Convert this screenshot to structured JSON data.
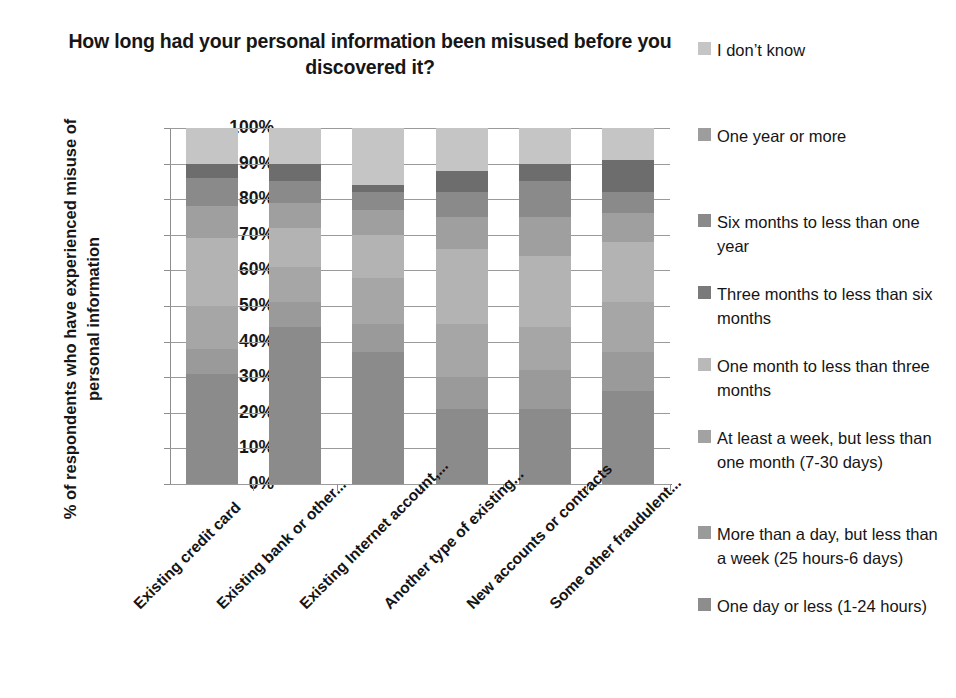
{
  "chart_data": {
    "type": "bar",
    "subtype": "stacked-bar-100-percent",
    "title": "How long had your personal information been misused before you discovered it?",
    "xlabel": "",
    "ylabel": "% of respondents who have experienced misuse of personal information",
    "ylim": [
      0,
      100
    ],
    "ytick_labels": [
      "100%",
      "90%",
      "80%",
      "70%",
      "60%",
      "50%",
      "40%",
      "30%",
      "20%",
      "10%",
      "0%"
    ],
    "ytick_values": [
      100,
      90,
      80,
      70,
      60,
      50,
      40,
      30,
      20,
      10,
      0
    ],
    "grid": true,
    "legend_position": "right",
    "categories": [
      "Existing credit card",
      "Existing bank or other...",
      "Existing Internet account,...",
      "Another type of existing...",
      "New accounts or contracts",
      "Some other fraudulent..."
    ],
    "series": [
      {
        "name": "One day or less (1-24 hours)",
        "color": "#8b8b8b",
        "values": [
          31,
          44,
          37,
          21,
          21,
          26
        ]
      },
      {
        "name": "More than a day, but less than a week (25 hours-6 days)",
        "color": "#9a9a9a",
        "values": [
          7,
          7,
          8,
          9,
          11,
          11
        ]
      },
      {
        "name": "At least a week, but less than one month (7-30 days)",
        "color": "#a6a6a6",
        "values": [
          12,
          10,
          13,
          15,
          12,
          14
        ]
      },
      {
        "name": "One month to less than three months",
        "color": "#b3b3b3",
        "values": [
          19,
          11,
          12,
          21,
          20,
          17
        ]
      },
      {
        "name": "Three months to less than six months",
        "color": "#9f9f9f",
        "values": [
          9,
          7,
          7,
          9,
          11,
          8
        ]
      },
      {
        "name": "Six months to less than one year",
        "color": "#8a8a8a",
        "values": [
          8,
          6,
          5,
          7,
          10,
          6
        ]
      },
      {
        "name": "One year or more",
        "color": "#6d6d6d",
        "values": [
          4,
          5,
          2,
          6,
          5,
          9
        ]
      },
      {
        "name": "I don't know",
        "color": "#c5c5c5",
        "values": [
          10,
          10,
          16,
          12,
          10,
          9
        ]
      }
    ]
  },
  "legend": {
    "items": [
      {
        "label": "I don’t know",
        "color": "#c5c5c5",
        "top": 8,
        "swatch": "legend-swatch-i-dont-know"
      },
      {
        "label": "One year or more",
        "color": "#9d9d9d",
        "top": 94,
        "swatch": "legend-swatch-one-year-or-more"
      },
      {
        "label": "Six months to less than one year",
        "color": "#8a8a8a",
        "top": 180,
        "swatch": "legend-swatch-six-months"
      },
      {
        "label": "Three months to less than six months",
        "color": "#7a7a7a",
        "top": 252,
        "swatch": "legend-swatch-three-months"
      },
      {
        "label": "One month to less than three months",
        "color": "#b9b9b9",
        "top": 324,
        "swatch": "legend-swatch-one-month"
      },
      {
        "label": "At least a week, but less than one month (7-30 days)",
        "color": "#a2a2a2",
        "top": 396,
        "swatch": "legend-swatch-at-least-a-week"
      },
      {
        "label": "More than a day, but less than a week (25 hours-6 days)",
        "color": "#9a9a9a",
        "top": 492,
        "swatch": "legend-swatch-more-than-a-day"
      },
      {
        "label": "One day or less (1-24 hours)",
        "color": "#8d8d8d",
        "top": 564,
        "swatch": "legend-swatch-one-day-or-less"
      }
    ]
  }
}
